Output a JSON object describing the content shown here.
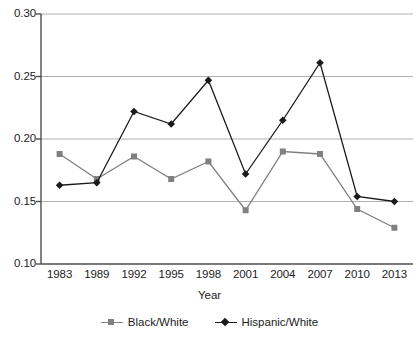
{
  "chart_data": {
    "type": "line",
    "title": "",
    "xlabel": "Year",
    "ylabel": "",
    "categories": [
      "1983",
      "1989",
      "1992",
      "1995",
      "1998",
      "2001",
      "2004",
      "2007",
      "2010",
      "2013"
    ],
    "series": [
      {
        "name": "Black/White",
        "marker": "square",
        "color": "#808080",
        "values": [
          0.188,
          0.168,
          0.186,
          0.168,
          0.182,
          0.143,
          0.19,
          0.188,
          0.144,
          0.129
        ]
      },
      {
        "name": "Hispanic/White",
        "marker": "diamond",
        "color": "#1a1a1a",
        "values": [
          0.163,
          0.165,
          0.222,
          0.212,
          0.247,
          0.172,
          0.215,
          0.261,
          0.154,
          0.15
        ]
      }
    ],
    "ylim": [
      0.1,
      0.3
    ],
    "yticks": [
      "0.10",
      "0.15",
      "0.20",
      "0.25",
      "0.30"
    ],
    "ytick_values": [
      0.1,
      0.15,
      0.2,
      0.25,
      0.3
    ],
    "grid": "horizontal",
    "legend_position": "bottom",
    "gridline_color": "#b0b0b0",
    "axis_color": "#4d4d4d"
  },
  "caption": {
    "text": ""
  }
}
